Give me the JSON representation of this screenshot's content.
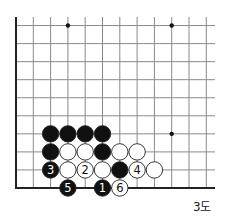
{
  "diagram": {
    "caption": "3도",
    "board": {
      "origin_x": 16,
      "origin_y": 188,
      "col_spacing": 17.3,
      "row_spacing": 18.05,
      "columns": 12,
      "rows": 10,
      "extend_right": 215,
      "extend_top": 17,
      "left_edge": true,
      "bottom_edge": true,
      "line_color": "#8a8a8a",
      "edge_color": "#222222"
    },
    "star_points": [
      {
        "col": 3,
        "row": 9
      },
      {
        "col": 9,
        "row": 9
      },
      {
        "col": 9,
        "row": 3
      }
    ],
    "stones": [
      {
        "col": 2,
        "row": 3,
        "color": "black",
        "label": ""
      },
      {
        "col": 3,
        "row": 3,
        "color": "black",
        "label": ""
      },
      {
        "col": 4,
        "row": 3,
        "color": "black",
        "label": ""
      },
      {
        "col": 5,
        "row": 3,
        "color": "black",
        "label": ""
      },
      {
        "col": 2,
        "row": 2,
        "color": "black",
        "label": ""
      },
      {
        "col": 3,
        "row": 2,
        "color": "white",
        "label": ""
      },
      {
        "col": 4,
        "row": 2,
        "color": "white",
        "label": ""
      },
      {
        "col": 5,
        "row": 2,
        "color": "black",
        "label": ""
      },
      {
        "col": 6,
        "row": 2,
        "color": "white",
        "label": ""
      },
      {
        "col": 7,
        "row": 2,
        "color": "white",
        "label": ""
      },
      {
        "col": 2,
        "row": 1,
        "color": "black",
        "label": "3"
      },
      {
        "col": 3,
        "row": 1,
        "color": "white",
        "label": ""
      },
      {
        "col": 4,
        "row": 1,
        "color": "white",
        "label": "2"
      },
      {
        "col": 5,
        "row": 1,
        "color": "white",
        "label": ""
      },
      {
        "col": 6,
        "row": 1,
        "color": "black",
        "label": ""
      },
      {
        "col": 7,
        "row": 1,
        "color": "white",
        "label": "4"
      },
      {
        "col": 8,
        "row": 1,
        "color": "white",
        "label": ""
      },
      {
        "col": 3,
        "row": 0,
        "color": "black",
        "label": "5"
      },
      {
        "col": 5,
        "row": 0,
        "color": "black",
        "label": "1"
      },
      {
        "col": 6,
        "row": 0,
        "color": "white",
        "label": "6"
      }
    ]
  }
}
